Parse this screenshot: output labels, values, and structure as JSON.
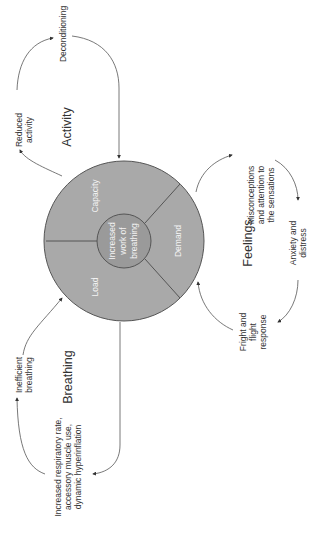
{
  "diagram": {
    "center": {
      "line1": "Increased",
      "line2": "work of",
      "line3": "breathing"
    },
    "segments": {
      "capacity": "Capacity",
      "demand": "Demand",
      "load": "Load"
    },
    "cycles": {
      "activity": {
        "title": "Activity",
        "items": [
          {
            "line1": "Reduced",
            "line2": "activity"
          },
          {
            "line1": "Deconditioning"
          }
        ]
      },
      "feelings": {
        "title": "Feelings",
        "items": [
          {
            "line1": "Misconceptions",
            "line2": "and attention to",
            "line3": "the sensations"
          },
          {
            "line1": "Anxiety and",
            "line2": "distress"
          },
          {
            "line1": "Fright and",
            "line2": "flight",
            "line3": "response"
          }
        ]
      },
      "breathing": {
        "title": "Breathing",
        "items": [
          {
            "line1": "Inefficient",
            "line2": "breathing"
          },
          {
            "line1": "Increased respiratory rate,",
            "line2": "accessory muscle use,",
            "line3": "dynamic hyperinflation"
          }
        ]
      }
    },
    "colors": {
      "outer": "#a9a9a9",
      "inner": "#9a9a9a",
      "stroke": "#555555",
      "text": "#333333"
    }
  }
}
